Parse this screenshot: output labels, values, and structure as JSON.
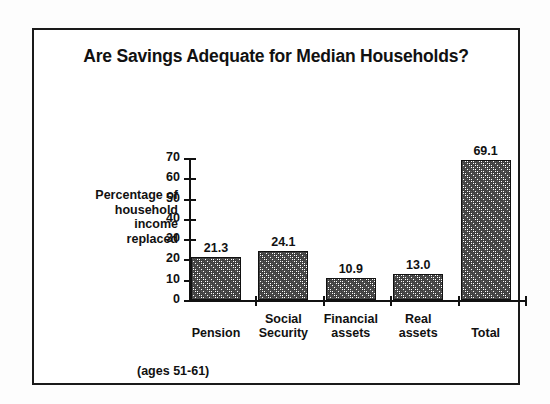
{
  "figure": {
    "title": "Are Savings Adequate for Median Households?",
    "footnote": "(ages 51-61)",
    "y_axis_title": "Percentage of\nhousehold\nincome\nreplaced"
  },
  "chart_data": {
    "type": "bar",
    "title": "Are Savings Adequate for Median Households?",
    "xlabel": "",
    "ylabel": "Percentage of household income replaced",
    "categories": [
      "Pension",
      "Social Security",
      "Financial assets",
      "Real assets",
      "Total"
    ],
    "values": [
      21.3,
      24.1,
      10.9,
      13.0,
      69.1
    ],
    "value_labels": [
      "21.3",
      "24.1",
      "10.9",
      "13.0",
      "69.1"
    ],
    "ylim": [
      0,
      70
    ],
    "yticks": [
      0,
      10,
      20,
      30,
      40,
      50,
      60,
      70
    ],
    "ytick_labels": [
      "0",
      "10",
      "20",
      "30",
      "40",
      "50",
      "60",
      "70"
    ],
    "grid": false,
    "legend": "none",
    "annotation": "(ages 51-61)",
    "bar_fill": "#3f3f3f",
    "bar_edge": "#111111"
  },
  "style": {
    "frame_color": "#1a1a1a",
    "background": "#ffffff",
    "text_color": "#111111"
  }
}
